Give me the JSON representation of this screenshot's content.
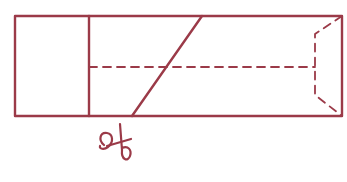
{
  "diagram": {
    "stroke_color": "#9b3a48",
    "outer_rect": {
      "x": 15,
      "y": 16,
      "width": 327,
      "height": 100
    },
    "divider_x": 89,
    "cut_line": {
      "x1": 202,
      "y1": 16,
      "x2": 132,
      "y2": 116
    },
    "fold_line": {
      "x1": 89,
      "y1": 67,
      "x2": 315,
      "y2": 67
    },
    "end_fold": [
      [
        342,
        16
      ],
      [
        315,
        34
      ],
      [
        315,
        95
      ],
      [
        342,
        116
      ]
    ],
    "scissors": {
      "icon": "scissors-icon",
      "x": 120,
      "y": 145
    }
  }
}
